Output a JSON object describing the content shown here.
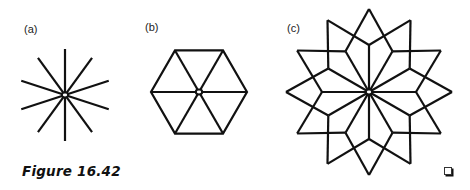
{
  "figure": {
    "caption": "Figure 16.42",
    "end_mark": "end-of-example-square",
    "stroke_color": "#111111",
    "panels": [
      {
        "id": "a",
        "label": "(a)",
        "description": "10 line segments radiating from a common center",
        "shape": "star-spokes",
        "spokes": 10,
        "center": [
          65,
          95
        ],
        "radius": 46,
        "start_angle_deg": 18
      },
      {
        "id": "b",
        "label": "(b)",
        "description": "Regular hexagon with 6 spokes from center to vertices",
        "shape": "hexagon-wheel",
        "sides": 6,
        "center": [
          199,
          92
        ],
        "radius": 48
      },
      {
        "id": "c",
        "label": "(c)",
        "description": "12-pointed star: 12 spokes to inner vertices, each outer tip joined to two neighboring inner vertices",
        "shape": "twelve-point-star",
        "points": 12,
        "center": [
          369,
          92
        ],
        "inner_radius": 47,
        "outer_radius": 83
      }
    ]
  }
}
